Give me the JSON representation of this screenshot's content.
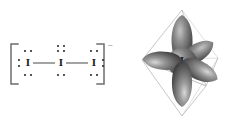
{
  "figure": {
    "panels": [
      {
        "id": "lewis",
        "name": "lewis-structure-panel"
      },
      {
        "id": "orbital",
        "name": "orbital-geometry-panel"
      }
    ]
  },
  "lewis": {
    "charge_symbol": "−",
    "bracket_left": "[",
    "bracket_right": "]",
    "atoms": [
      {
        "id": "left",
        "label": "I",
        "x": 28,
        "y": 63,
        "lone_pairs": [
          "top",
          "bottom",
          "left"
        ]
      },
      {
        "id": "center",
        "label": "I",
        "x": 61,
        "y": 63,
        "lone_pairs": [
          "top",
          "bottom",
          "top2"
        ]
      },
      {
        "id": "right",
        "label": "I",
        "x": 94,
        "y": 63,
        "lone_pairs": [
          "top",
          "bottom",
          "right"
        ]
      }
    ],
    "bonds": [
      {
        "from": "left",
        "to": "center",
        "order": 1
      },
      {
        "from": "center",
        "to": "right",
        "order": 1
      }
    ]
  },
  "orbital": {
    "center_label": "I",
    "geometry": "trigonal-bipyramidal",
    "lobe_count": 5,
    "lobes": [
      {
        "id": "axial-top",
        "angle": -90,
        "length": 47,
        "width": 19
      },
      {
        "id": "axial-bottom",
        "angle": 90,
        "length": 45,
        "width": 19
      },
      {
        "id": "equatorial-left",
        "angle": 182,
        "length": 40,
        "width": 18
      },
      {
        "id": "equatorial-ur",
        "angle": -32,
        "length": 38,
        "width": 17
      },
      {
        "id": "equatorial-lr",
        "angle": 26,
        "length": 40,
        "width": 18
      }
    ],
    "colors": {
      "lobe_dark": "#4a4a4a",
      "lobe_mid": "#7d7d7d",
      "lobe_light": "#c9c9c9",
      "core": "#5a5a5a",
      "wireframe": "#b9b9b9",
      "background": "#ffffff"
    }
  }
}
